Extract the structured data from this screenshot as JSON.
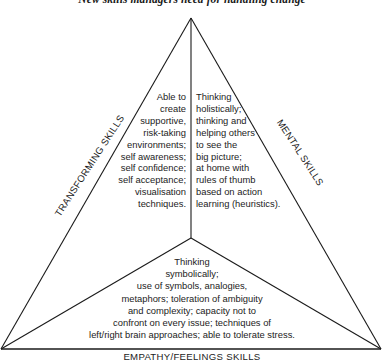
{
  "title": "New skills managers need for handling change",
  "diagram": {
    "type": "triangle-three-sectors",
    "colors": {
      "line": "#1a1a1a",
      "text": "#1c1c1c",
      "background": "#ffffff"
    },
    "sides": {
      "left": "TRANSFORMING SKILLS",
      "right": "MENTAL SKILLS",
      "bottom": "EMPATHY/FEELINGS SKILLS"
    },
    "sectors": {
      "left": {
        "lines": [
          "Able to",
          "create",
          "supportive,",
          "risk-taking",
          "environments;",
          "self awareness;",
          "self confidence;",
          "self acceptance;",
          "visualisation",
          "techniques."
        ]
      },
      "right": {
        "lines": [
          "Thinking",
          "holistically;",
          "thinking and",
          "helping others",
          "to see the",
          "big picture;",
          "at home with",
          "rules of thumb",
          "based on action",
          "learning (heuristics)."
        ]
      },
      "bottom": {
        "lines": [
          "Thinking",
          "symbolically;",
          "use of symbols, analogies,",
          "metaphors; toleration of ambiguity",
          "and complexity; capacity not to",
          "confront on every issue; techniques of",
          "left/right brain approaches; able to tolerate stress."
        ]
      }
    }
  }
}
